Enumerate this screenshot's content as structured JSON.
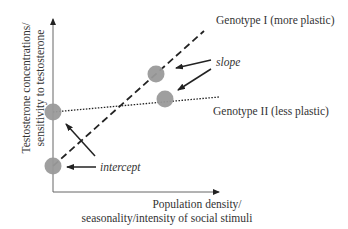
{
  "diagram": {
    "title": "",
    "y_axis": {
      "line1": "Testosterone concentrations/",
      "line2": "sensitivity to testosterone"
    },
    "x_axis": {
      "line1": "Population density/",
      "line2": "seasonality/intensity of social stimuli"
    },
    "genotypes": [
      {
        "label": "Genotype I (more plastic)",
        "line_style": "dashed"
      },
      {
        "label": "Genotype II (less plastic)",
        "line_style": "dotted"
      }
    ],
    "annotations": {
      "slope": "slope",
      "intercept": "intercept"
    },
    "colors": {
      "point": "#9a9a9a",
      "line": "#222222",
      "axis": "#555555"
    }
  }
}
